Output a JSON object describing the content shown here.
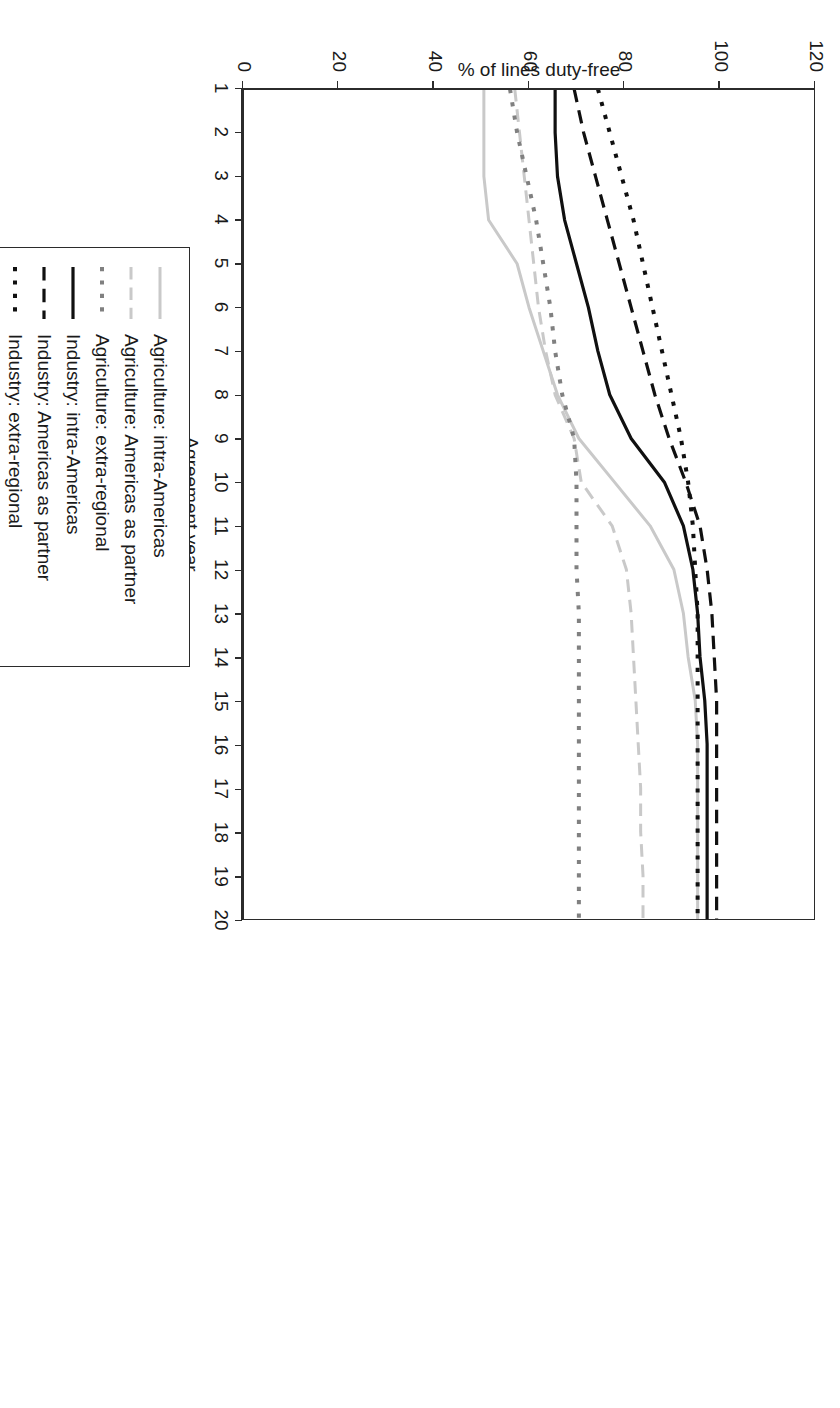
{
  "chart_data": {
    "type": "line",
    "title": "",
    "xlabel": "Agreement year",
    "ylabel": "% of lines duty-free",
    "xlim": [
      1,
      20
    ],
    "ylim": [
      0,
      120
    ],
    "xticks": [
      "1",
      "2",
      "3",
      "4",
      "5",
      "6",
      "7",
      "8",
      "9",
      "10",
      "11",
      "12",
      "13",
      "14",
      "15",
      "16",
      "17",
      "18",
      "19",
      "20"
    ],
    "yticks": [
      "0",
      "20",
      "40",
      "60",
      "80",
      "100",
      "120"
    ],
    "grid": false,
    "legend_position": "below-right",
    "x": [
      1,
      2,
      3,
      4,
      5,
      6,
      7,
      8,
      9,
      10,
      11,
      12,
      13,
      14,
      15,
      16,
      17,
      18,
      19,
      20
    ],
    "series": [
      {
        "name": "Agriculture: intra-Americas",
        "color": "#c9c9c9",
        "style": "solid",
        "width": 3,
        "values": [
          50.5,
          50.5,
          50.5,
          51.5,
          57.5,
          60.0,
          63.0,
          66.0,
          70.5,
          78.0,
          85.5,
          90.5,
          92.5,
          93.5,
          95.0,
          95.5,
          95.5,
          95.5,
          95.5,
          95.5
        ]
      },
      {
        "name": "Agriculture: Americas as partner",
        "color": "#c9c9c9",
        "style": "dashed",
        "width": 3,
        "values": [
          57.0,
          58.0,
          59.0,
          60.0,
          61.0,
          62.0,
          63.5,
          65.5,
          69.5,
          71.0,
          77.5,
          80.5,
          81.5,
          82.0,
          82.5,
          83.0,
          83.5,
          83.5,
          84.0,
          84.0
        ]
      },
      {
        "name": "Agriculture: extra-regional",
        "color": "#808080",
        "style": "dotted",
        "width": 4,
        "values": [
          56.0,
          57.5,
          59.5,
          61.5,
          63.0,
          64.5,
          65.5,
          67.0,
          69.5,
          70.0,
          70.0,
          70.0,
          70.5,
          70.5,
          70.5,
          70.5,
          70.5,
          70.5,
          70.5,
          70.5
        ]
      },
      {
        "name": "Industry: intra-Americas",
        "color": "#101010",
        "style": "solid",
        "width": 3.2,
        "values": [
          65.5,
          65.5,
          66.0,
          67.5,
          70.0,
          72.5,
          74.5,
          77.0,
          81.5,
          88.5,
          92.5,
          94.5,
          95.5,
          96.0,
          97.0,
          97.5,
          97.5,
          97.5,
          97.5,
          97.5
        ]
      },
      {
        "name": "Industry: Americas as partner",
        "color": "#101010",
        "style": "dashed",
        "width": 3.2,
        "values": [
          69.5,
          71.5,
          74.0,
          76.5,
          79.0,
          81.5,
          84.0,
          86.5,
          89.5,
          93.0,
          96.0,
          97.5,
          98.5,
          99.0,
          99.5,
          99.5,
          99.5,
          99.5,
          99.5,
          99.5
        ]
      },
      {
        "name": "Industry: extra-regional",
        "color": "#101010",
        "style": "dotted",
        "width": 4,
        "values": [
          74.5,
          77.0,
          79.5,
          82.0,
          84.0,
          86.0,
          88.0,
          90.0,
          92.0,
          93.5,
          94.5,
          95.0,
          95.5,
          95.5,
          95.5,
          95.5,
          95.5,
          95.5,
          95.5,
          95.5
        ]
      }
    ]
  },
  "axes": {
    "x_title": "Agreement year",
    "y_title": "% of lines duty-free"
  },
  "legend": {
    "items": [
      {
        "label": "Agriculture: intra-Americas"
      },
      {
        "label": "Agriculture: Americas as partner"
      },
      {
        "label": "Agriculture: extra-regional"
      },
      {
        "label": "Industry: intra-Americas"
      },
      {
        "label": "Industry: Americas as partner"
      },
      {
        "label": "Industry: extra-regional"
      }
    ]
  }
}
